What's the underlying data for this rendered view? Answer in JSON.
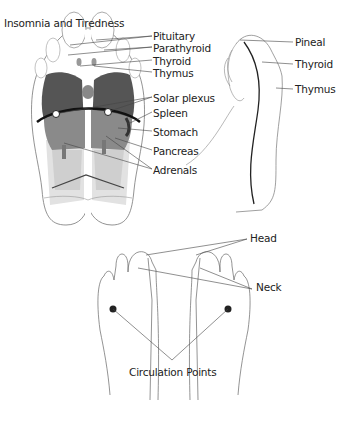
{
  "title": "Insomnia and Tiredness",
  "sole_labels": [
    {
      "text": "Pituitary",
      "x": 153,
      "y": 30
    },
    {
      "text": "Parathyroid",
      "x": 153,
      "y": 42
    },
    {
      "text": "Thyroid",
      "x": 153,
      "y": 55
    },
    {
      "text": "Thymus",
      "x": 153,
      "y": 67
    },
    {
      "text": "Solar plexus",
      "x": 153,
      "y": 92
    },
    {
      "text": "Spleen",
      "x": 153,
      "y": 107
    },
    {
      "text": "Stomach",
      "x": 153,
      "y": 126
    },
    {
      "text": "Pancreas",
      "x": 153,
      "y": 145
    },
    {
      "text": "Adrenals",
      "x": 153,
      "y": 164
    }
  ],
  "side_labels": [
    {
      "text": "Pineal",
      "x": 295,
      "y": 39
    },
    {
      "text": "Thyroid",
      "x": 295,
      "y": 61
    },
    {
      "text": "Thymus",
      "x": 295,
      "y": 86
    }
  ],
  "top_labels": [
    {
      "text": "Head",
      "x": 255,
      "y": 234
    },
    {
      "text": "Neck",
      "x": 258,
      "y": 278
    }
  ],
  "bottom_label": {
    "text": "Circulation Points",
    "x": 130,
    "y": 368
  },
  "colors": {
    "dark": "#4a4a4a",
    "mid": "#8a8a8a",
    "light": "#cfcfcf",
    "lighter": "#e2e2e2",
    "line": "#555555",
    "text": "#222222"
  }
}
